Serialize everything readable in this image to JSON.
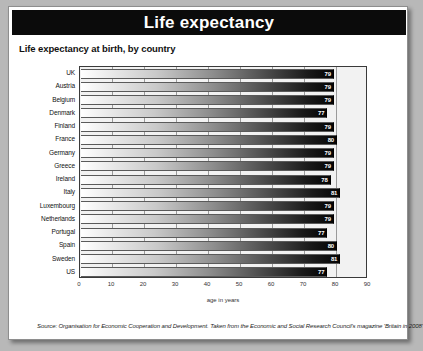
{
  "banner": {
    "title": "Life expectancy"
  },
  "subtitle": "Life expectancy at birth, by country",
  "source_note": "Source: Organisation for Economic Cooperation and Development. Taken from the Economic and Social Research Council's magazine 'Britain in 2008'.",
  "chart_data": {
    "type": "bar",
    "orientation": "horizontal",
    "title": "Life expectancy",
    "subtitle": "Life expectancy at birth, by country",
    "xlabel": "age in years",
    "ylabel": "",
    "xlim": [
      0,
      90
    ],
    "xticks": [
      "0",
      "10",
      "20",
      "30",
      "40",
      "50",
      "60",
      "70",
      "80",
      "90"
    ],
    "xtick_values": [
      0,
      10,
      20,
      30,
      40,
      50,
      60,
      70,
      80,
      90
    ],
    "grid": true,
    "legend": "none",
    "categories": [
      "UK",
      "Austria",
      "Belgium",
      "Denmark",
      "Finland",
      "France",
      "Germany",
      "Greece",
      "Ireland",
      "Italy",
      "Luxembourg",
      "Netherlands",
      "Portugal",
      "Spain",
      "Sweden",
      "US"
    ],
    "values": [
      79,
      79,
      79,
      77,
      79,
      80,
      79,
      79,
      78,
      81,
      79,
      79,
      77,
      80,
      81,
      77
    ],
    "data_labels": [
      "79",
      "79",
      "79",
      "77",
      "79",
      "80",
      "79",
      "79",
      "78",
      "81",
      "79",
      "79",
      "77",
      "80",
      "81",
      "77"
    ]
  }
}
